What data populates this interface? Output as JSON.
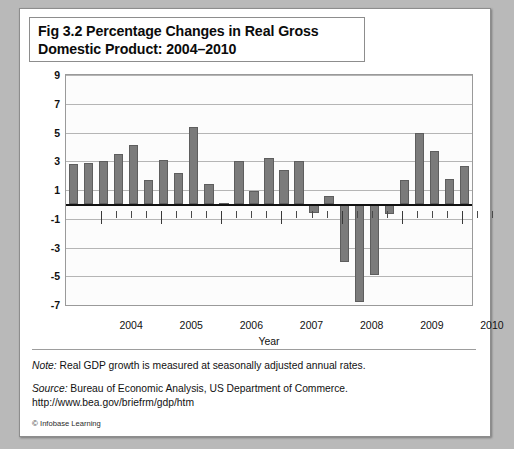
{
  "title": "Fig 3.2 Percentage Changes in Real Gross\nDomestic Product: 2004–2010",
  "axis": {
    "x_title": "Year",
    "x_labels": [
      "2004",
      "2005",
      "2006",
      "2007",
      "2008",
      "2009",
      "2010"
    ],
    "y_ticks": [
      "9",
      "7",
      "5",
      "3",
      "1",
      "-1",
      "-3",
      "-5",
      "-7"
    ]
  },
  "notes": {
    "note_label": "Note:",
    "note_text": " Real GDP growth is measured at seasonally adjusted annual rates.",
    "source_label": "Source:",
    "source_text": " Bureau of Economic Analysis, US Department of Commerce.",
    "source_url": "http://www.bea.gov/briefrm/gdp/htm",
    "credit_symbol": "©",
    "credit_text": " Infobase Learning"
  },
  "colors": {
    "bar_fill": "#7b7b7b",
    "bar_border": "#5e5e5e",
    "grid": "#b5b5b5",
    "zero_axis": "#111111",
    "page_background": "#b9b9b9",
    "card_background": "#ffffff"
  },
  "chart_data": {
    "type": "bar",
    "title": "Fig 3.2 Percentage Changes in Real Gross Domestic Product: 2004–2010",
    "xlabel": "Year",
    "ylabel": "",
    "ylim": [
      -7,
      9
    ],
    "ytick_values": [
      9,
      7,
      5,
      3,
      1,
      -1,
      -3,
      -5,
      -7
    ],
    "grid": true,
    "legend": false,
    "x_tick_labels": [
      "2004",
      "2005",
      "2006",
      "2007",
      "2008",
      "2009",
      "2010"
    ],
    "categories": [
      "2004 Q1",
      "2004 Q2",
      "2004 Q3",
      "2004 Q4",
      "2005 Q1",
      "2005 Q2",
      "2005 Q3",
      "2005 Q4",
      "2006 Q1",
      "2006 Q2",
      "2006 Q3",
      "2006 Q4",
      "2007 Q1",
      "2007 Q2",
      "2007 Q3",
      "2007 Q4",
      "2008 Q1",
      "2008 Q2",
      "2008 Q3",
      "2008 Q4",
      "2009 Q1",
      "2009 Q2",
      "2009 Q3",
      "2009 Q4",
      "2010 Q1",
      "2010 Q2",
      "2010 Q3"
    ],
    "values": [
      2.8,
      2.9,
      3.0,
      3.5,
      4.1,
      1.7,
      3.1,
      2.2,
      5.4,
      1.4,
      0.1,
      3.0,
      0.9,
      3.2,
      2.4,
      3.0,
      -0.6,
      0.6,
      -4.0,
      -6.8,
      -4.9,
      -0.7,
      1.7,
      5.0,
      3.7,
      1.8,
      2.7
    ],
    "units": "percent change, seasonally adjusted annual rate"
  }
}
